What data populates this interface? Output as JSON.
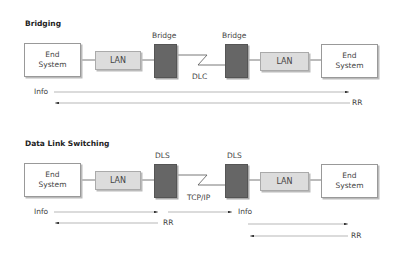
{
  "bridging": {
    "title": "Bridging",
    "left_end_system": [
      "End",
      "System"
    ],
    "left_lan": "LAN",
    "left_device": "Bridge",
    "wan_label": "DLC",
    "right_device": "Bridge",
    "right_lan": "LAN",
    "right_end_system": [
      "End",
      "System"
    ],
    "flows": [
      {
        "label": "Info",
        "direction": "right"
      },
      {
        "label": "RR",
        "direction": "left"
      }
    ]
  },
  "dls": {
    "title": "Data Link Switching",
    "left_end_system": [
      "End",
      "System"
    ],
    "left_lan": "LAN",
    "left_device": "DLS",
    "wan_label": "TCP/IP",
    "right_device": "DLS",
    "right_lan": "LAN",
    "right_end_system": [
      "End",
      "System"
    ],
    "flows": [
      {
        "label": "Info",
        "direction": "right",
        "segment": "left"
      },
      {
        "label": "RR",
        "direction": "left",
        "segment": "left"
      },
      {
        "label": "Info",
        "direction": "right",
        "segment": "middle"
      },
      {
        "label": "",
        "direction": "right",
        "segment": "right"
      },
      {
        "label": "RR",
        "direction": "left",
        "segment": "right"
      }
    ]
  },
  "colors": {
    "device_fill": "#666666",
    "lan_fill": "#dcdcdc",
    "line": "#555555"
  }
}
